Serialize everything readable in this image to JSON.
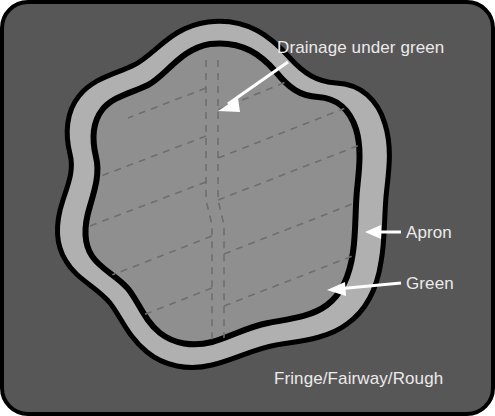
{
  "diagram": {
    "background_label": "Fringe/Fairway/Rough",
    "labels": {
      "drainage": "Drainage under green",
      "apron": "Apron",
      "green": "Green"
    },
    "colors": {
      "rough_fill": "#575757",
      "apron_fill": "#b0b0b0",
      "green_fill": "#8f8f8f",
      "outline": "#000000",
      "label_text": "#eceaea",
      "leader_line": "#ffffff",
      "drain_dash": "#6e6e6e"
    },
    "regions": [
      {
        "name": "Fringe/Fairway/Rough",
        "fill": "#575757"
      },
      {
        "name": "Apron",
        "fill": "#b0b0b0"
      },
      {
        "name": "Green",
        "fill": "#8f8f8f"
      }
    ],
    "drainage": {
      "pattern": "herringbone",
      "main_line": "central vertical trunk",
      "lateral_count_left": 5,
      "lateral_count_right": 5,
      "style": "dashed"
    }
  }
}
